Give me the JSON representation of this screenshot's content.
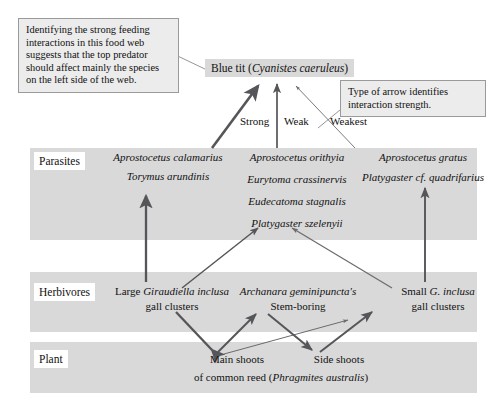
{
  "figure": {
    "type": "food-web-diagram",
    "colors": {
      "band": "#d9d9d9",
      "callout_fill": "#ececec",
      "callout_border": "#9a9a9a",
      "arrow": "#55555a",
      "background": "#ffffff"
    }
  },
  "callouts": {
    "left": "Identifying the strong feeding interactions in this food web suggests that the top predator should affect mainly the species on the left side of the web.",
    "right": "Type of arrow identifies interaction strength."
  },
  "top_predator": {
    "label": "Blue tit (Cyanistes caeruleus)",
    "common_name": "Blue tit",
    "scientific_name": "Cyanistes caeruleus"
  },
  "arrow_key": {
    "strong": "Strong",
    "weak": "Weak",
    "weakest": "Weakest"
  },
  "levels": {
    "parasites": "Parasites",
    "herbivores": "Herbivores",
    "plant": "Plant"
  },
  "parasites": {
    "left_group": [
      "Aprostocetus calamarius",
      "Torymus arundinis"
    ],
    "middle_group": [
      "Aprostocetus orithyia",
      "Eurytoma crassinervis",
      "Eudecatoma stagnalis",
      "Platygaster szelenyii"
    ],
    "right_group": [
      "Aprostocetus gratus",
      "Platygaster cf. quadrifarius"
    ]
  },
  "herbivores": {
    "left": {
      "line1_prefix": "Large ",
      "line1_sci": "Giraudiella inclusa",
      "line2": "gall clusters"
    },
    "middle": {
      "line1_sci": "Archanara geminipuncta's",
      "line2": "Stem-boring"
    },
    "right": {
      "line1_prefix": "Small ",
      "line1_sci": "G. inclusa",
      "line2": "gall clusters"
    }
  },
  "plant": {
    "main_shoots": "Main shoots",
    "side_shoots": "Side shoots",
    "reed_prefix": "of common reed (",
    "reed_sci": "Phragmites australis",
    "reed_suffix": ")"
  }
}
